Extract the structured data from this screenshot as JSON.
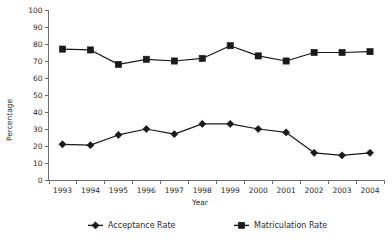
{
  "chart_data": {
    "type": "line",
    "title": "",
    "xlabel": "Year",
    "ylabel": "Percentage",
    "categories": [
      "1993",
      "1994",
      "1995",
      "1996",
      "1997",
      "1998",
      "1999",
      "2000",
      "2001",
      "2002",
      "2003",
      "2004"
    ],
    "series": [
      {
        "name": "Acceptance Rate",
        "marker": "diamond",
        "color": "#1a1a1a",
        "values": [
          21,
          20.5,
          26.5,
          30,
          27,
          33,
          33,
          30,
          28,
          16,
          14.5,
          16
        ]
      },
      {
        "name": "Matriculation Rate",
        "marker": "square",
        "color": "#1a1a1a",
        "values": [
          77,
          76.5,
          68,
          71,
          70,
          71.5,
          79,
          73,
          70,
          75,
          75,
          75.5
        ]
      }
    ],
    "ylim": [
      0,
      100
    ],
    "y_ticks": [
      "0",
      "10",
      "20",
      "30",
      "40",
      "50",
      "60",
      "70",
      "80",
      "90",
      "100"
    ],
    "grid": false,
    "legend_position": "bottom"
  },
  "legend": {
    "entries": [
      {
        "label": "Acceptance Rate",
        "marker": "diamond"
      },
      {
        "label": "Matriculation Rate",
        "marker": "square"
      }
    ]
  }
}
